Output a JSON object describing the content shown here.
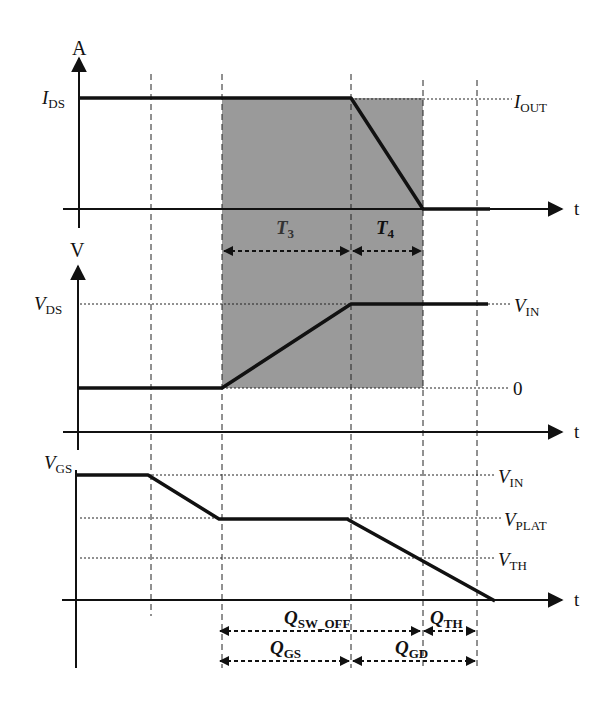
{
  "diagram": {
    "colors": {
      "shade": "#9a9a9a",
      "line": "#111111",
      "background": "#ffffff"
    },
    "panels": {
      "current": {
        "y_axis_label": "A",
        "x_axis_label": "t",
        "left_label": {
          "main": "I",
          "sub": "DS"
        },
        "right_label": {
          "main": "I",
          "sub": "OUT"
        }
      },
      "drain_voltage": {
        "y_axis_label": "V",
        "x_axis_label": "t",
        "left_label": {
          "main": "V",
          "sub": "DS"
        },
        "right_label_high": {
          "main": "V",
          "sub": "IN"
        },
        "right_label_low": "0"
      },
      "gate_voltage": {
        "x_axis_label": "t",
        "left_label": {
          "main": "V",
          "sub": "GS"
        },
        "right_labels": [
          {
            "main": "V",
            "sub": "IN"
          },
          {
            "main": "V",
            "sub": "PLAT"
          },
          {
            "main": "V",
            "sub": "TH"
          }
        ]
      }
    },
    "intervals": {
      "t3": {
        "main": "T",
        "sub": "3"
      },
      "t4": {
        "main": "T",
        "sub": "4"
      }
    },
    "charges": {
      "sw_off": {
        "main": "Q",
        "sub": "SW_OFF"
      },
      "th": {
        "main": "Q",
        "sub": "TH"
      },
      "gs": {
        "main": "Q",
        "sub": "GS"
      },
      "gd": {
        "main": "Q",
        "sub": "GD"
      }
    }
  }
}
